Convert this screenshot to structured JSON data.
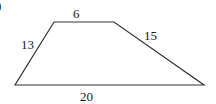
{
  "figure": {
    "partial_label": ")",
    "shape": "trapezoid",
    "sides": {
      "top": "6",
      "right": "15",
      "bottom": "20",
      "left": "13"
    },
    "vertices": [
      [
        54,
        22
      ],
      [
        114,
        22
      ],
      [
        204,
        85
      ],
      [
        15,
        85
      ]
    ],
    "stroke_color": "#333333"
  }
}
